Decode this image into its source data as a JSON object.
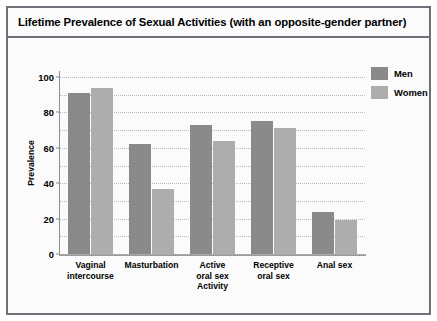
{
  "chart_data": {
    "type": "bar",
    "title": "Lifetime Prevalence of Sexual Activities (with an opposite-gender partner)",
    "xlabel": "Activity",
    "ylabel": "Prevalence",
    "categories": [
      "Vaginal intercourse",
      "Masturbation",
      "Active oral sex",
      "Receptive oral sex",
      "Anal sex"
    ],
    "category_lines": [
      [
        "Vaginal",
        "intercourse"
      ],
      [
        "Masturbation"
      ],
      [
        "Active",
        "oral sex"
      ],
      [
        "Receptive",
        "oral sex"
      ],
      [
        "Anal sex"
      ]
    ],
    "series": [
      {
        "name": "Men",
        "color": "#8a8a8a",
        "values": [
          91,
          62,
          73,
          75,
          24
        ]
      },
      {
        "name": "Women",
        "color": "#adadad",
        "values": [
          94,
          37,
          64,
          71,
          19
        ]
      }
    ],
    "ylim": [
      0,
      100
    ],
    "yticks": [
      0,
      20,
      40,
      60,
      80,
      100
    ],
    "ytick_labels": [
      "0",
      "20",
      "40",
      "60",
      "80",
      "100"
    ],
    "minor_gridlines": [
      10,
      30,
      50,
      70,
      90
    ],
    "grid": true,
    "legend_position": "top-right"
  }
}
